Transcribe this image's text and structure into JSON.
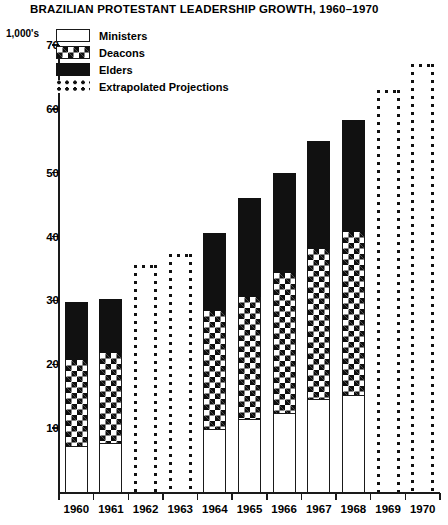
{
  "chart_data": {
    "type": "bar",
    "title": "BRAZILIAN PROTESTANT LEADERSHIP GROWTH, 1960–1970",
    "unit_label": "1,000's",
    "xlabel": "",
    "ylabel": "",
    "ylim": [
      0,
      70
    ],
    "y_ticks": [
      10,
      20,
      30,
      40,
      50,
      60,
      70
    ],
    "grid": false,
    "legend_position": "top-left",
    "stacked": true,
    "categories": [
      "1960",
      "1961",
      "1962",
      "1963",
      "1964",
      "1965",
      "1966",
      "1967",
      "1968",
      "1969",
      "1970"
    ],
    "series": [
      {
        "name": "Ministers",
        "swatch": "white-outline",
        "values": [
          7.2,
          7.7,
          null,
          null,
          9.8,
          11.4,
          12.4,
          14.5,
          15.2,
          null,
          null
        ]
      },
      {
        "name": "Deacons",
        "swatch": "crosshatch",
        "values": [
          13.4,
          14.0,
          null,
          null,
          18.6,
          19.2,
          21.9,
          23.5,
          25.5,
          null,
          null
        ]
      },
      {
        "name": "Elders",
        "swatch": "solid-black",
        "values": [
          9.2,
          8.6,
          null,
          null,
          12.2,
          15.5,
          15.6,
          16.9,
          17.6,
          null,
          null
        ]
      }
    ],
    "totals": [
      29.8,
      30.3,
      35.5,
      37.2,
      40.6,
      46.1,
      49.9,
      54.9,
      58.3,
      62.9,
      67.0
    ],
    "segment_tops": {
      "ministers": [
        7.2,
        7.7,
        null,
        null,
        9.8,
        11.4,
        12.4,
        14.5,
        15.2,
        null,
        null
      ],
      "deacons": [
        20.6,
        21.7,
        null,
        null,
        28.4,
        30.6,
        34.3,
        38.0,
        40.7,
        null,
        null
      ],
      "elders": [
        29.8,
        30.3,
        null,
        null,
        40.6,
        46.1,
        49.9,
        54.9,
        58.3,
        null,
        null
      ]
    },
    "projected_categories": [
      "1962",
      "1963",
      "1969",
      "1970"
    ],
    "projected_values": [
      35.5,
      37.2,
      62.9,
      67.0
    ],
    "annotations": []
  },
  "legend": {
    "items": [
      {
        "label": "Ministers",
        "swatch": "white-outline"
      },
      {
        "label": "Deacons",
        "swatch": "crosshatch"
      },
      {
        "label": "Elders",
        "swatch": "solid-black"
      },
      {
        "label": "Extrapolated Projections",
        "swatch": "dotted-outline"
      }
    ]
  },
  "colors": {
    "ink": "#111111",
    "background": "#ffffff"
  }
}
